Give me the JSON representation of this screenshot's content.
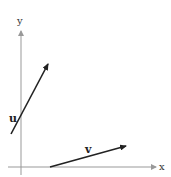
{
  "diagram": {
    "axes": {
      "x_label": "x",
      "y_label": "y",
      "color": "#999999"
    },
    "vectors": [
      {
        "name": "u",
        "label": "u",
        "color": "#222222"
      },
      {
        "name": "v",
        "label": "v",
        "color": "#222222"
      }
    ]
  }
}
